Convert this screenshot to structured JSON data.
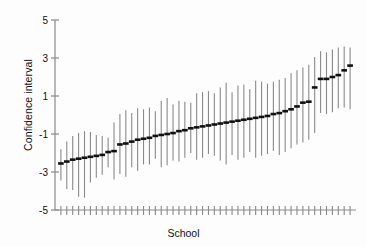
{
  "chart_data": {
    "type": "scatter",
    "title": "",
    "xlabel": "School",
    "ylabel": "Confidence interval",
    "ylim": [
      -5,
      5
    ],
    "yticks": [
      5,
      3,
      1,
      -1,
      -3,
      -5
    ],
    "ytick_labels": [
      "5",
      "3",
      "1",
      "-1",
      "-3",
      "-5"
    ],
    "grid": false,
    "legend": null,
    "xtick_labels": [],
    "n_points": 50,
    "marker": "horizontal-dash",
    "errorbar_style": "vertical-line-no-caps",
    "series": [
      {
        "name": "School confidence intervals",
        "x": [
          1,
          2,
          3,
          4,
          5,
          6,
          7,
          8,
          9,
          10,
          11,
          12,
          13,
          14,
          15,
          16,
          17,
          18,
          19,
          20,
          21,
          22,
          23,
          24,
          25,
          26,
          27,
          28,
          29,
          30,
          31,
          32,
          33,
          34,
          35,
          36,
          37,
          38,
          39,
          40,
          41,
          42,
          43,
          44,
          45,
          46,
          47,
          48,
          49,
          50
        ],
        "estimate": [
          -2.55,
          -2.45,
          -2.35,
          -2.3,
          -2.25,
          -2.2,
          -2.15,
          -2.1,
          -1.95,
          -1.9,
          -1.55,
          -1.5,
          -1.4,
          -1.3,
          -1.25,
          -1.2,
          -1.1,
          -1.05,
          -1.0,
          -0.95,
          -0.85,
          -0.8,
          -0.7,
          -0.65,
          -0.6,
          -0.55,
          -0.5,
          -0.45,
          -0.4,
          -0.35,
          -0.3,
          -0.25,
          -0.2,
          -0.15,
          -0.1,
          -0.05,
          0.05,
          0.1,
          0.2,
          0.3,
          0.45,
          0.65,
          0.7,
          1.45,
          1.9,
          1.9,
          2.0,
          2.1,
          2.35,
          2.6,
          2.9,
          3.5
        ],
        "ci_lower": [
          -3.45,
          -3.9,
          -3.95,
          -4.3,
          -4.35,
          -3.55,
          -3.3,
          -3.15,
          -2.75,
          -3.4,
          -3.1,
          -3.25,
          -2.75,
          -2.95,
          -2.6,
          -2.6,
          -2.3,
          -2.75,
          -2.65,
          -2.4,
          -2.45,
          -2.25,
          -2.0,
          -2.35,
          -2.25,
          -2.05,
          -2.15,
          -2.4,
          -2.6,
          -2.1,
          -2.35,
          -2.25,
          -1.95,
          -2.25,
          -2.15,
          -2.05,
          -1.9,
          -2.1,
          -1.95,
          -1.75,
          -1.55,
          -1.45,
          -1.3,
          -0.95,
          0.1,
          0.05,
          0.15,
          0.35,
          0.4,
          0.3,
          0.6,
          1.65
        ],
        "ci_upper": [
          -1.8,
          -1.4,
          -1.1,
          -0.95,
          -0.85,
          -0.9,
          -1.05,
          -1.1,
          -1.2,
          -0.4,
          0.05,
          0.25,
          0.1,
          0.35,
          0.3,
          0.4,
          0.2,
          0.75,
          0.9,
          0.55,
          0.75,
          0.7,
          0.65,
          1.15,
          1.2,
          1.25,
          1.15,
          1.45,
          1.7,
          1.2,
          1.55,
          1.6,
          1.35,
          1.8,
          1.75,
          1.65,
          1.75,
          1.85,
          1.95,
          2.2,
          2.35,
          2.5,
          2.65,
          3.05,
          3.35,
          3.3,
          3.45,
          3.55,
          3.6,
          3.55,
          3.8,
          4.85
        ]
      }
    ]
  },
  "axis": {
    "y_axis_label": "Confidence interval",
    "x_axis_label": "School"
  },
  "colors": {
    "marker": "#111111",
    "errorbar": "#8a8a8a",
    "axis": "#8a8a8a",
    "text": "#111111",
    "background": "#fdfdfd"
  }
}
